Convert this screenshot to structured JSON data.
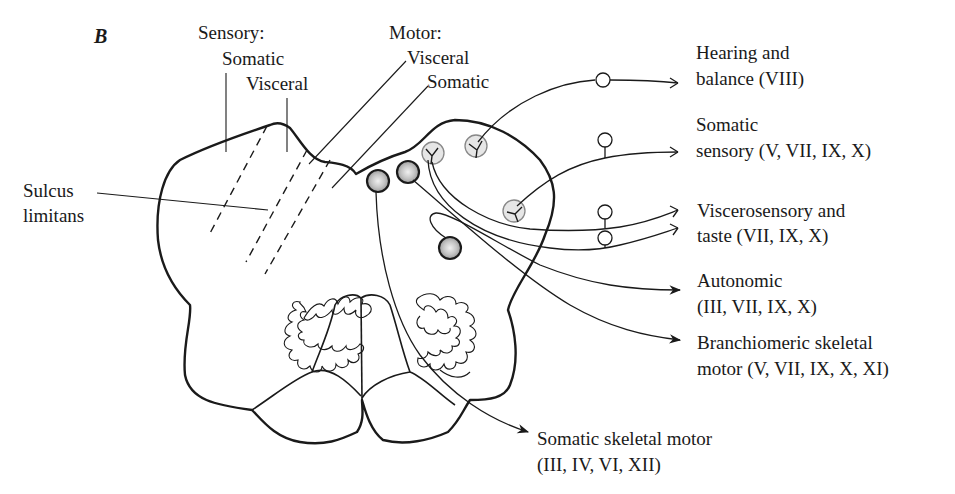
{
  "figure": {
    "panel_label": "B"
  },
  "labels": {
    "sensory_header": "Sensory:",
    "sensory_somatic": "Somatic",
    "sensory_visceral": "Visceral",
    "motor_header": "Motor:",
    "motor_visceral": "Visceral",
    "motor_somatic": "Somatic",
    "sulcus_line1": "Sulcus",
    "sulcus_line2": "limitans"
  },
  "pathways": [
    {
      "id": "hearing",
      "line1": "Hearing and",
      "line2": "balance (VIII)",
      "type": "sensory-afferent"
    },
    {
      "id": "somatic-sensory",
      "line1": "Somatic",
      "line2": "sensory (V, VII, IX, X)",
      "type": "sensory-afferent"
    },
    {
      "id": "viscerosensory",
      "line1": "Viscerosensory and",
      "line2": "taste (VII, IX, X)",
      "type": "sensory-afferent"
    },
    {
      "id": "autonomic",
      "line1": "Autonomic",
      "line2": "(III, VII, IX, X)",
      "type": "motor-efferent"
    },
    {
      "id": "branchiomeric",
      "line1": "Branchiomeric skeletal",
      "line2": "motor (V, VII, IX, X, XI)",
      "type": "motor-efferent"
    },
    {
      "id": "somatic-skeletal",
      "line1": "Somatic skeletal motor",
      "line2": "(III, IV, VI, XII)",
      "type": "motor-efferent"
    }
  ],
  "colors": {
    "stroke": "#1a1a1a",
    "motor_nucleus_fill": "#b8b8b8",
    "sensory_nucleus_fill": "#e2e2e2"
  }
}
